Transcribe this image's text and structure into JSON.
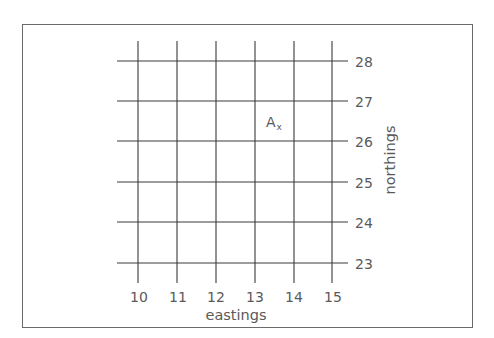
{
  "diagram": {
    "type": "grid-reference",
    "x_axis": {
      "label": "eastings",
      "ticks": [
        "10",
        "11",
        "12",
        "13",
        "14",
        "15"
      ]
    },
    "y_axis": {
      "label": "northings",
      "ticks": [
        "28",
        "27",
        "26",
        "25",
        "24",
        "23"
      ]
    },
    "points": [
      {
        "label": "A",
        "marker": "x",
        "easting_approx": 13.3,
        "northing_approx": 26.5
      }
    ],
    "colors": {
      "lines": "#333333",
      "text": "#5a5a5a",
      "frame": "#6a6a6a"
    }
  }
}
